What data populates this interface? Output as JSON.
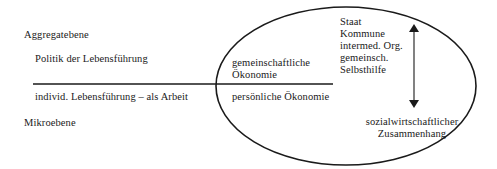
{
  "diagram": {
    "levels": {
      "top": "Aggregatebene",
      "bottom": "Mikroebene"
    },
    "left_column": {
      "upper": "Politik der Lebensführung",
      "lower": "individ. Lebensführung – als Arbeit"
    },
    "middle_column": {
      "upper_line1": "gemeinschaftliche",
      "upper_line2": "Ökonomie",
      "lower": "persönliche Ökonomie"
    },
    "right_column": {
      "upper_lines": [
        "Staat",
        "Kommune",
        "intermed. Org.",
        "gemeinsch.",
        "Selbsthilfe"
      ],
      "lower_line1": "sozialwirtschaftlicher",
      "lower_line2": "Zusammenhang"
    },
    "shapes": {
      "divider_line": {
        "x1": 33,
        "x2": 333,
        "y": 84
      },
      "ellipse": {
        "cx": 346,
        "cy": 86,
        "rx": 130,
        "ry": 79
      },
      "arrow": {
        "x": 414,
        "y1": 24,
        "y2": 108,
        "type": "double-headed"
      }
    },
    "colors": {
      "stroke": "#1a1a1a",
      "text": "#1a1a1a",
      "background": "#ffffff"
    }
  }
}
